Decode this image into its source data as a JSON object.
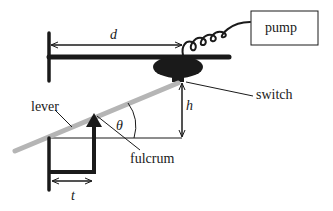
{
  "diagram": {
    "labels": {
      "pump": "pump",
      "switch": "switch",
      "lever": "lever",
      "fulcrum": "fulcrum"
    },
    "variables": {
      "d": "d",
      "h": "h",
      "theta": "θ",
      "t": "t"
    },
    "colors": {
      "stroke": "#1a1a1a",
      "lever": "#b5b5b5",
      "background": "#ffffff"
    }
  }
}
